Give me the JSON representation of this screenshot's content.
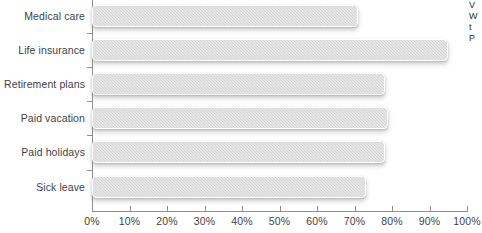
{
  "chart_data": {
    "type": "bar",
    "orientation": "horizontal",
    "title": "",
    "subtitle": "",
    "xlabel": "",
    "ylabel": "",
    "categories": [
      "Medical care",
      "Life insurance",
      "Retirement plans",
      "Paid vacation",
      "Paid holidays",
      "Sick leave"
    ],
    "values": [
      71,
      95,
      78,
      79,
      78,
      73
    ],
    "value_unit": "%",
    "xlim": [
      0,
      100
    ],
    "x_tick_labels": [
      "0%",
      "10%",
      "20%",
      "30%",
      "40%",
      "50%",
      "60%",
      "70%",
      "80%",
      "90%",
      "100%"
    ],
    "x_tick_values": [
      0,
      10,
      20,
      30,
      40,
      50,
      60,
      70,
      80,
      90,
      100
    ],
    "grid": false,
    "legend": "none",
    "series": [
      {
        "name": "",
        "values": [
          71,
          95,
          78,
          79,
          78,
          73
        ]
      }
    ],
    "colors": {
      "bar_fill": "#d2d2d2",
      "bar_border": "#ffffff",
      "axis": "#8f8f93",
      "text": "#3f3f3f",
      "background": "#ffffff"
    }
  },
  "edge_note": {
    "lines": [
      "V",
      "W",
      "t",
      "P"
    ]
  }
}
